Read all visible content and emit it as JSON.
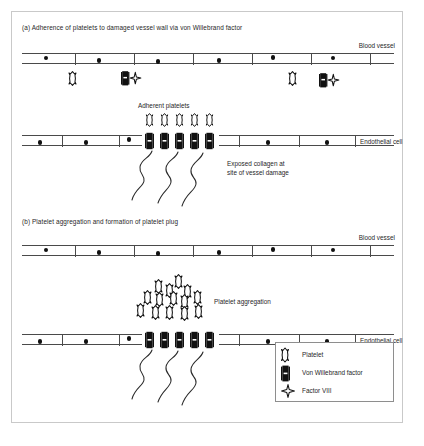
{
  "figure": {
    "panels": [
      {
        "id": "a",
        "title": "(a) Adherence of platelets to damaged vessel wall via von Willebrand factor",
        "vessel_label": "Blood vessel",
        "endothelial_label": "Endothelial cell",
        "annotations": [
          {
            "name": "adherent-platelets",
            "text": "Adherent platelets"
          },
          {
            "name": "exposed-collagen-line1",
            "text": "Exposed collagen at"
          },
          {
            "name": "exposed-collagen-line2",
            "text": "site of vessel damage"
          }
        ],
        "top_wall_nuclei": 6,
        "bottom_wall_left_nuclei": 3,
        "bottom_wall_right_nuclei": 2,
        "free_platelets": 2,
        "free_vwf_f8_complexes": 2,
        "adherent_platelets": 5,
        "wall_bound_vwf": 5,
        "collagen_fibers": 3
      },
      {
        "id": "b",
        "title": "(b) Platelet aggregation and formation of platelet plug",
        "vessel_label": "Blood vessel",
        "endothelial_label": "Endothelial cell",
        "annotations": [
          {
            "name": "platelet-aggregation",
            "text": "Platelet aggregation"
          }
        ],
        "top_wall_nuclei": 6,
        "bottom_wall_left_nuclei": 3,
        "bottom_wall_right_nuclei": 2,
        "aggregated_platelets": 14,
        "wall_bound_vwf": 5,
        "collagen_fibers": 3
      }
    ],
    "legend": {
      "items": [
        {
          "icon": "platelet-icon",
          "label": "Platelet"
        },
        {
          "icon": "von-willebrand-factor-icon",
          "label": "Von Willebrand factor"
        },
        {
          "icon": "factor-viii-icon",
          "label": "Factor VIII"
        }
      ]
    },
    "colors": {
      "ink": "#1a1a1a",
      "wall_line": "#4a4a4a",
      "glyph_fill": "#111111",
      "border": "#c9c9c9",
      "legend_border": "#8e8e8e",
      "background": "#ffffff"
    }
  }
}
